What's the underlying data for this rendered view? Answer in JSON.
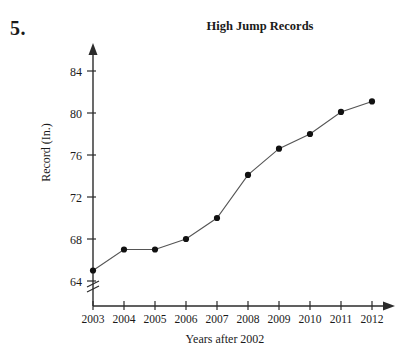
{
  "problem": {
    "number": "5."
  },
  "chart_data": {
    "type": "line",
    "title": "High Jump Records",
    "xlabel": "Years after 2002",
    "ylabel": "Record (In.)",
    "categories": [
      "2003",
      "2004",
      "2005",
      "2006",
      "2007",
      "2008",
      "2009",
      "2010",
      "2011",
      "2012"
    ],
    "values": [
      65,
      67,
      67,
      68,
      70,
      74.1,
      76.6,
      78,
      80.1,
      81.1
    ],
    "y_ticks": [
      "64",
      "68",
      "72",
      "76",
      "80",
      "84"
    ],
    "y_tick_values": [
      64,
      68,
      72,
      76,
      80,
      84
    ],
    "ylim": [
      64,
      85
    ],
    "xlim": [
      "2003",
      "2012"
    ],
    "grid": false,
    "legend": false,
    "axis_break": true,
    "marker": "filled-circle",
    "line_color": "#555555",
    "marker_color": "#111111",
    "axis_color": "#2b2b2b",
    "background": "#ffffff"
  }
}
